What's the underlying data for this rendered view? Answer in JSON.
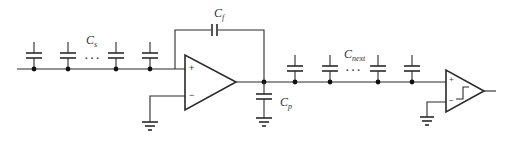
{
  "diagram": {
    "type": "circuit-schematic",
    "title": "",
    "labels": {
      "input_caps": {
        "main": "C",
        "sub": "s"
      },
      "feedback_cap": {
        "main": "C",
        "sub": "f"
      },
      "parasitic_cap": {
        "main": "C",
        "sub": "p"
      },
      "next_caps": {
        "main": "C",
        "sub": "next"
      }
    },
    "ellipsis": "···",
    "opamp": {
      "plus": "+",
      "minus": "−"
    },
    "comparator": {
      "plus": "+",
      "minus": "−",
      "symbol": "hysteresis"
    },
    "components": [
      {
        "id": "Cs-array",
        "kind": "capacitor-array",
        "count_shown": 4
      },
      {
        "id": "Cf",
        "kind": "capacitor",
        "connection": "feedback"
      },
      {
        "id": "opamp",
        "kind": "operational-amplifier",
        "minus_input": "ground"
      },
      {
        "id": "Cp",
        "kind": "capacitor",
        "connection": "output-to-ground"
      },
      {
        "id": "Cnext-array",
        "kind": "capacitor-array",
        "count_shown": 4
      },
      {
        "id": "comparator",
        "kind": "comparator",
        "minus_input": "ground"
      }
    ],
    "colors": {
      "wire": "#2a2a2a",
      "background": "#ffffff"
    }
  }
}
